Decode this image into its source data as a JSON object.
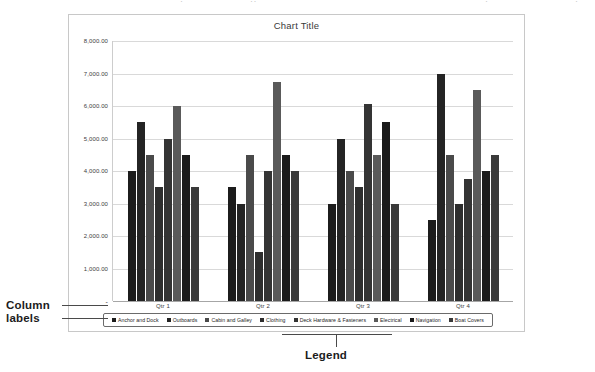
{
  "scan_artifacts": {
    "top_fragments": [
      "·",
      "··",
      "·",
      "·"
    ]
  },
  "annotations": {
    "column_labels": "Column\nlabels",
    "column_labels_line1": "Column",
    "column_labels_line2": "labels",
    "legend": "Legend"
  },
  "chart_data": {
    "type": "bar",
    "title": "Chart Title",
    "xlabel": "",
    "ylabel": "",
    "ylim": [
      0,
      8000
    ],
    "ytick_labels": [
      "-",
      "1,000.00",
      "2,000.00",
      "3,000.00",
      "4,000.00",
      "5,000.00",
      "6,000.00",
      "7,000.00",
      "8,000.00"
    ],
    "ytick_values": [
      0,
      1000,
      2000,
      3000,
      4000,
      5000,
      6000,
      7000,
      8000
    ],
    "grid": true,
    "legend_position": "bottom",
    "categories": [
      "Qtr 1",
      "Qtr 2",
      "Qtr 3",
      "Qtr 4"
    ],
    "series": [
      {
        "name": "Anchor and Dock",
        "color": "#1c1c1c",
        "values": [
          4000,
          3500,
          3000,
          2500
        ]
      },
      {
        "name": "Outboards",
        "color": "#242424",
        "values": [
          5500,
          3000,
          5000,
          7000
        ]
      },
      {
        "name": "Cabin and Galley",
        "color": "#4a4a4a",
        "values": [
          4500,
          4500,
          4000,
          4500
        ]
      },
      {
        "name": "Clothing",
        "color": "#2e2e2e",
        "values": [
          3500,
          1500,
          3500,
          3000
        ]
      },
      {
        "name": "Deck Hardware & Fasteners",
        "color": "#343434",
        "values": [
          5000,
          4000,
          6050,
          3750
        ]
      },
      {
        "name": "Electrical",
        "color": "#5a5a5a",
        "values": [
          6000,
          6750,
          4500,
          6500
        ]
      },
      {
        "name": "Navigation",
        "color": "#1a1a1a",
        "values": [
          4500,
          4500,
          5500,
          4000
        ]
      },
      {
        "name": "Boat Covers",
        "color": "#3a3a3a",
        "values": [
          3500,
          4000,
          3000,
          4500
        ]
      }
    ]
  }
}
